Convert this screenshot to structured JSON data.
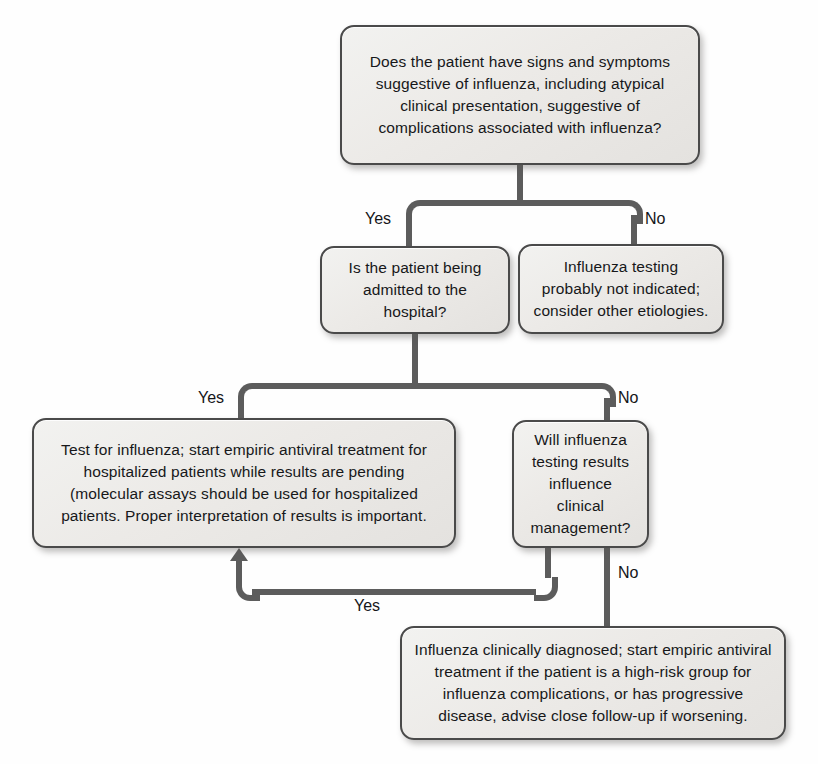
{
  "diagram": {
    "line_color": "#5c5c5c",
    "box_border_color": "#4a4a4a",
    "box_fill_color": "#eceae7",
    "text_color": "#17181a"
  },
  "nodes": [
    {
      "id": "root-question",
      "text": "Does the patient have signs and symptoms suggestive of influenza, including atypical clinical presentation, suggestive of complications associated with influenza?"
    },
    {
      "id": "admitted-question",
      "text": "Is the patient being admitted to the hospital?"
    },
    {
      "id": "not-indicated-outcome",
      "text": "Influenza testing probably not indicated; consider other etiologies."
    },
    {
      "id": "test-influenza-outcome",
      "text": "Test for influenza; start empiric antiviral treatment for hospitalized patients while results are pending (molecular assays should be used for hospitalized patients. Proper interpretation of results is important."
    },
    {
      "id": "influence-management-question",
      "text": "Will influenza testing results influence clinical management?"
    },
    {
      "id": "clinically-diagnosed-outcome",
      "text": "Influenza clinically diagnosed; start empiric antiviral treatment if the patient is a high-risk group for influenza complications, or has progressive disease, advise close follow-up if worsening."
    }
  ],
  "edge_labels": {
    "root_yes": "Yes",
    "root_no": "No",
    "admitted_yes": "Yes",
    "admitted_no": "No",
    "influence_yes": "Yes",
    "influence_no": "No"
  }
}
